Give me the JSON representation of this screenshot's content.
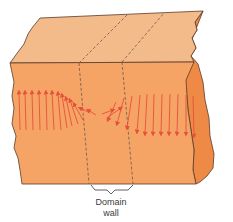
{
  "figure": {
    "type": "domain-wall-diagram",
    "label_line1": "Domain",
    "label_line2": "wall",
    "colors": {
      "top_face": "#f4bb8a",
      "front_face": "#f5a466",
      "side_face": "#ee8a45",
      "outline": "#5a3a2a",
      "arrows": "#e8503a",
      "dashed": "#6a5a50",
      "label": "#3a3a3a"
    },
    "left_domain_arrows": 11,
    "right_domain_arrows": 11,
    "left_domain_direction": "up",
    "right_domain_direction": "down",
    "transition": "magnetic moments rotate gradually through the wall"
  }
}
